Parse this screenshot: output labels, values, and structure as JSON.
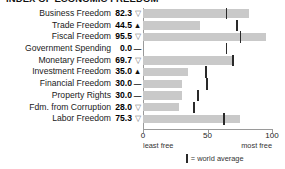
{
  "title": "INDEX OF ECONOMIC FREEDOM",
  "axis": {
    "ticks": [
      {
        "label": "0",
        "value": 0
      },
      {
        "label": "50",
        "value": 50
      },
      {
        "label": "100",
        "value": 100
      }
    ],
    "left_end_label": "least free",
    "right_end_label": "most free",
    "min": 0,
    "max": 100
  },
  "legend": {
    "mark": "world-average-tick",
    "text": "= world average"
  },
  "colors": {
    "bar": "#c9c9c9",
    "tick_mark": "#2a2a2a",
    "axis": "#9a9a9a",
    "text": "#1a1a1a"
  },
  "chart_data": {
    "type": "bar",
    "title": "INDEX OF ECONOMIC FREEDOM",
    "xlabel": "",
    "ylabel": "",
    "xlim": [
      0,
      100
    ],
    "grid": false,
    "orientation": "horizontal",
    "legend_position": "bottom",
    "categories": [
      "Business Freedom",
      "Trade Freedom",
      "Fiscal Freedom",
      "Government Spending",
      "Monetary Freedom",
      "Investment Freedom",
      "Financial Freedom",
      "Property Rights",
      "Fdm. from Corruption",
      "Labor Freedom"
    ],
    "values": [
      82.3,
      44.5,
      95.5,
      0.0,
      69.7,
      35.0,
      30.0,
      30.0,
      28.0,
      75.3
    ],
    "world_average": [
      64,
      72,
      75,
      64,
      69,
      48,
      49,
      42,
      39,
      62
    ],
    "trend": [
      "down",
      "up",
      "down",
      "flat",
      "down",
      "up",
      "flat",
      "flat",
      "down",
      "down"
    ],
    "series": [
      {
        "name": "Score",
        "values": [
          82.3,
          44.5,
          95.5,
          0.0,
          69.7,
          35.0,
          30.0,
          30.0,
          28.0,
          75.3
        ]
      },
      {
        "name": "World average",
        "values": [
          64,
          72,
          75,
          64,
          69,
          48,
          49,
          42,
          39,
          62
        ]
      }
    ]
  },
  "rows": [
    {
      "label": "Business Freedom",
      "value": "82.3",
      "trend": "down",
      "glyph": "▽"
    },
    {
      "label": "Trade Freedom",
      "value": "44.5",
      "trend": "up",
      "glyph": "▲"
    },
    {
      "label": "Fiscal Freedom",
      "value": "95.5",
      "trend": "down",
      "glyph": "▽"
    },
    {
      "label": "Government Spending",
      "value": "0.0",
      "trend": "flat",
      "glyph": "—"
    },
    {
      "label": "Monetary Freedom",
      "value": "69.7",
      "trend": "down",
      "glyph": "▽"
    },
    {
      "label": "Investment Freedom",
      "value": "35.0",
      "trend": "up",
      "glyph": "▲"
    },
    {
      "label": "Financial Freedom",
      "value": "30.0",
      "trend": "flat",
      "glyph": "—"
    },
    {
      "label": "Property Rights",
      "value": "30.0",
      "trend": "flat",
      "glyph": "—"
    },
    {
      "label": "Fdm. from Corruption",
      "value": "28.0",
      "trend": "down",
      "glyph": "▽"
    },
    {
      "label": "Labor Freedom",
      "value": "75.3",
      "trend": "down",
      "glyph": "▽"
    }
  ]
}
